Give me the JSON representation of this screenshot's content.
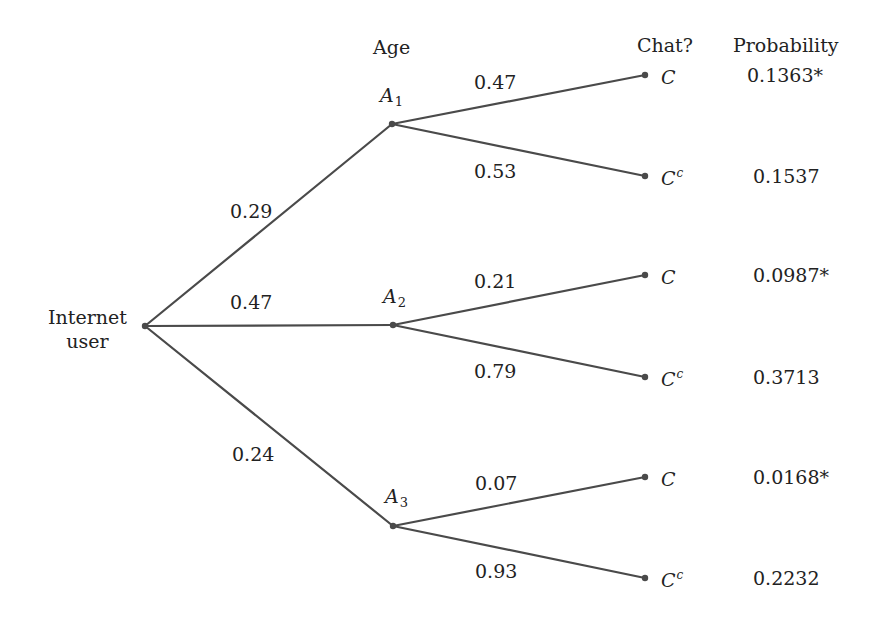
{
  "headers": {
    "age": "Age",
    "chat": "Chat?",
    "probability": "Probability"
  },
  "root": {
    "line1": "Internet",
    "line2": "user"
  },
  "age_nodes": [
    {
      "letter": "A",
      "sub": "1",
      "prob": "0.29"
    },
    {
      "letter": "A",
      "sub": "2",
      "prob": "0.47"
    },
    {
      "letter": "A",
      "sub": "3",
      "prob": "0.24"
    }
  ],
  "leaves": [
    {
      "letter": "C",
      "sup": "",
      "branch_prob": "0.47",
      "joint": "0.1363*"
    },
    {
      "letter": "C",
      "sup": "c",
      "branch_prob": "0.53",
      "joint": "0.1537"
    },
    {
      "letter": "C",
      "sup": "",
      "branch_prob": "0.21",
      "joint": "0.0987*"
    },
    {
      "letter": "C",
      "sup": "c",
      "branch_prob": "0.79",
      "joint": "0.3713"
    },
    {
      "letter": "C",
      "sup": "",
      "branch_prob": "0.07",
      "joint": "0.0168*"
    },
    {
      "letter": "C",
      "sup": "c",
      "branch_prob": "0.93",
      "joint": "0.2232"
    }
  ],
  "colors": {
    "line": "#4a4a4a",
    "text": "#222222"
  }
}
